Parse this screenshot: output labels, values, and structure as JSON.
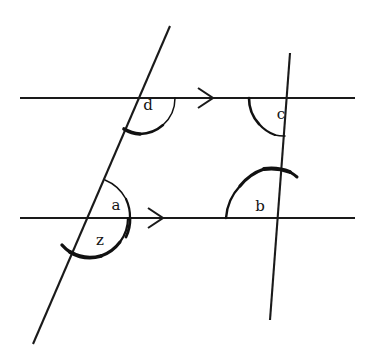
{
  "figure": {
    "background_color": "#ffffff",
    "stroke_color": "#1a1a1a",
    "width": 371,
    "height": 357
  },
  "lines": [
    {
      "name": "upper-parallel-line",
      "kind": "horizontal-parallel",
      "x1": 20,
      "y1": 98,
      "x2": 355,
      "y2": 98,
      "tick_marks": 1
    },
    {
      "name": "lower-parallel-line",
      "kind": "horizontal-parallel",
      "x1": 20,
      "y1": 218,
      "x2": 355,
      "y2": 218,
      "tick_marks": 1
    },
    {
      "name": "left-transversal",
      "kind": "transversal",
      "x1": 170,
      "y1": 26,
      "x2": 33,
      "y2": 344
    },
    {
      "name": "right-transversal",
      "kind": "transversal",
      "x1": 290,
      "y1": 53,
      "x2": 270,
      "y2": 320
    }
  ],
  "arrow_markers": [
    {
      "name": "upper-parallel-arrow",
      "x": 207,
      "y": 98,
      "direction": "right"
    },
    {
      "name": "lower-parallel-arrow",
      "x": 157,
      "y": 218,
      "direction": "right"
    }
  ],
  "intersections": [
    {
      "name": "upper-left-vertex",
      "x": 139,
      "y": 98
    },
    {
      "name": "upper-right-vertex",
      "x": 287,
      "y": 98
    },
    {
      "name": "lower-left-vertex",
      "x": 88,
      "y": 218
    },
    {
      "name": "lower-right-vertex",
      "x": 278,
      "y": 218
    }
  ],
  "angles": [
    {
      "name": "angle-d",
      "label": "d",
      "label_x": 148,
      "label_y": 106,
      "vertex": "upper-left-vertex",
      "description": "Angle between the upper parallel line (to the right) and the left transversal (going down-left)."
    },
    {
      "name": "angle-c",
      "label": "c",
      "label_x": 281,
      "label_y": 115,
      "vertex": "upper-right-vertex",
      "description": "Angle between the upper parallel line (to the left) and the right transversal (going down)."
    },
    {
      "name": "angle-a",
      "label": "a",
      "label_x": 116,
      "label_y": 206,
      "vertex": "lower-left-vertex",
      "description": "Angle between the lower parallel line (to the right) and the left transversal (going up-right)."
    },
    {
      "name": "angle-z",
      "label": "z",
      "label_x": 100,
      "label_y": 241,
      "vertex": "lower-left-vertex",
      "description": "Reflex-style angle below the lower parallel line, from the line going right around to the left transversal going down-left."
    },
    {
      "name": "angle-b",
      "label": "b",
      "label_x": 260,
      "label_y": 207,
      "vertex": "lower-right-vertex",
      "description": "Angle between the lower parallel line (to the left) and the right transversal (going up)."
    }
  ]
}
